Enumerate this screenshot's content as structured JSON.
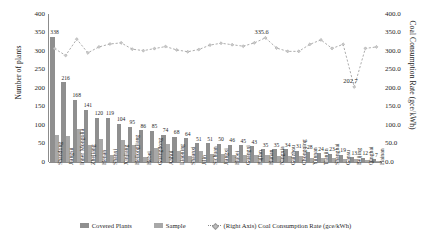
{
  "chart_data": {
    "type": "bar",
    "title": "",
    "xlabel": "",
    "ylabel": "Number of plants",
    "ylabel_secondary": "Coal Consumption Rate (gce/kWh)",
    "ylim": [
      0,
      400
    ],
    "ylim_secondary": [
      0.0,
      400.0
    ],
    "grid": false,
    "legend_position": "bottom",
    "y_ticks_left": [
      "0",
      "50",
      "100",
      "150",
      "200",
      "250",
      "300",
      "350",
      "400"
    ],
    "y_ticks_right": [
      "0.0",
      "50.0",
      "100.0",
      "150.0",
      "200.0",
      "250.0",
      "300.0",
      "350.0",
      "400.0"
    ],
    "categories": [
      "Shandong",
      "Jiangsu",
      "Inner Mongolia",
      "Zhejiang",
      "Henan",
      "Shanxi",
      "Xinjiang",
      "Heilongjiang",
      "Hebei",
      "Guangdong",
      "Anhui",
      "Liaoning",
      "Shaanxi",
      "Jilin",
      "Sichuan",
      "Jiangxi",
      "Hubei",
      "Guangxi",
      "Fujian",
      "Hunan",
      "Ningxia",
      "Guizhou",
      "Chongqing",
      "Yunnan",
      "Tianjin",
      "Shanghai",
      "Gansu",
      "Beijing",
      "Qinghai",
      "Hainan"
    ],
    "series": [
      {
        "name": "Covered Plants",
        "axis": "left",
        "color": "#8f8f8f",
        "values": [
          338,
          216,
          168,
          141,
          120,
          119,
          104,
          95,
          86,
          85,
          74,
          68,
          64,
          51,
          51,
          50,
          46,
          45,
          43,
          35,
          35,
          34,
          31,
          28,
          24,
          23,
          19,
          13,
          12,
          7
        ],
        "labels": [
          "338",
          "216",
          "168",
          "141",
          "120",
          "119",
          "104",
          "95",
          "86",
          "85",
          "74",
          "68",
          "64",
          "51",
          "51",
          "50",
          "46",
          "45",
          "43",
          "35",
          "35",
          "34",
          "31",
          "28",
          "24",
          "23",
          "19",
          "13",
          "12",
          "7"
        ]
      },
      {
        "name": "Sample",
        "axis": "left",
        "color": "#a8a8a8",
        "values": [
          72,
          70,
          90,
          46,
          62,
          20,
          60,
          46,
          13,
          38,
          48,
          30,
          16,
          30,
          22,
          22,
          20,
          20,
          20,
          18,
          16,
          16,
          15,
          12,
          12,
          10,
          9,
          7,
          6,
          4
        ]
      },
      {
        "name": "(Right Axis) Coal Consumption Rate (gce/kWh)",
        "axis": "right",
        "color": "#8a8a8a",
        "style": "dotted-line-with-markers",
        "values": [
          306.5,
          288.0,
          332.0,
          295.0,
          311.0,
          319.0,
          322.0,
          305.0,
          301.0,
          306.5,
          312.0,
          303.0,
          298.0,
          304.0,
          316.0,
          321.0,
          317.0,
          313.0,
          322.0,
          335.6,
          308.0,
          299.0,
          299.0,
          318.0,
          330.0,
          307.0,
          318.0,
          202.7,
          307.0,
          311.0
        ],
        "annotations": [
          {
            "index": 19,
            "label": "335.6"
          },
          {
            "index": 27,
            "label": "202.7"
          }
        ]
      }
    ]
  },
  "legend": {
    "items": [
      {
        "label": "Covered Plants",
        "kind": "swatch-covered"
      },
      {
        "label": "Sample",
        "kind": "swatch-sample"
      },
      {
        "label": "(Right Axis) Coal Consumption Rate (gce/kWh)",
        "kind": "swatch-line"
      }
    ]
  }
}
